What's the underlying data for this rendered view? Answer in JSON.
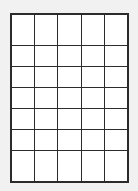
{
  "page": {
    "background_color": "#f1f1f1",
    "width": 138,
    "height": 191
  },
  "grid": {
    "name": "empty-grid",
    "columns": 5,
    "rows": 7,
    "cell_count": 35,
    "border_color": "#2b2b2b",
    "outer_border_width": "2px",
    "inner_border_width": "1px",
    "cell_fill_color": "#ffffff",
    "column_headers": [
      "",
      "",
      "",
      "",
      ""
    ],
    "cells": [
      [
        "",
        "",
        "",
        "",
        ""
      ],
      [
        "",
        "",
        "",
        "",
        ""
      ],
      [
        "",
        "",
        "",
        "",
        ""
      ],
      [
        "",
        "",
        "",
        "",
        ""
      ],
      [
        "",
        "",
        "",
        "",
        ""
      ],
      [
        "",
        "",
        "",
        "",
        ""
      ],
      [
        "",
        "",
        "",
        "",
        ""
      ]
    ]
  }
}
